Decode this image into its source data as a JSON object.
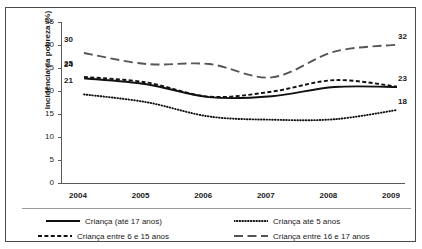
{
  "figure": {
    "title_remnant": "",
    "border_color": "#4a4a4a"
  },
  "chart_data": {
    "type": "line",
    "title": "",
    "xlabel": "",
    "ylabel": "Incidência da pobreza (%)",
    "x": [
      "2004",
      "2005",
      "2006",
      "2007",
      "2008",
      "2009"
    ],
    "categories": [
      "2004",
      "2005",
      "2006",
      "2007",
      "2008",
      "2009"
    ],
    "xtick_labels": [
      "2004",
      "2005",
      "2006",
      "2007",
      "2008",
      "2009"
    ],
    "ytick_labels": [
      "0",
      "5",
      "10",
      "15",
      "20",
      "25",
      "30",
      "35"
    ],
    "yticks": [
      0,
      5,
      10,
      15,
      20,
      25,
      30,
      35
    ],
    "ylim": [
      0,
      35
    ],
    "grid": false,
    "legend_position": "below-axes",
    "series": [
      {
        "name": "Criança (até 17 anos)",
        "style": "solid",
        "color": "#111111",
        "values": [
          24.5,
          23.2,
          20.4,
          20.6,
          22.6,
          22.6
        ],
        "start_label": "24",
        "end_label": "23"
      },
      {
        "name": "Criança até 5 anos",
        "style": "dotted",
        "color": "#111111",
        "values": [
          21.0,
          19.3,
          16.2,
          15.5,
          15.6,
          17.6
        ],
        "start_label": "21",
        "end_label": "18"
      },
      {
        "name": "Criança entre 6 e 15 anos",
        "style": "dashed",
        "color": "#111111",
        "values": [
          24.8,
          23.6,
          20.5,
          21.6,
          24.1,
          22.7
        ],
        "start_label": "25",
        "end_label": null
      },
      {
        "name": "Criança entre 16 e 17 anos",
        "style": "long-dash",
        "color": "#555555",
        "values": [
          30.0,
          27.6,
          27.6,
          24.7,
          30.3,
          31.8
        ],
        "start_label": "30",
        "end_label": "32"
      }
    ],
    "annotations": {
      "left": [
        "30",
        "25",
        "24",
        "21"
      ],
      "right": [
        "32",
        "23",
        "18"
      ]
    }
  },
  "legend": {
    "items": [
      {
        "label": "Criança (até 17 anos)",
        "style": "solid"
      },
      {
        "label": "Criança até 5 anos",
        "style": "dotted"
      },
      {
        "label": "Criança entre 6 e 15 anos",
        "style": "dashed"
      },
      {
        "label": "Criança entre 16 e 17 anos",
        "style": "long-dash"
      }
    ]
  }
}
